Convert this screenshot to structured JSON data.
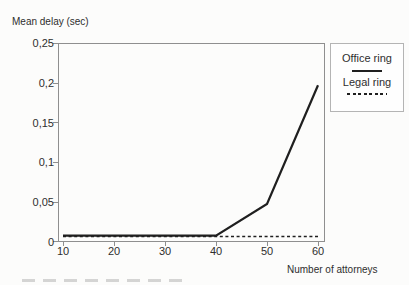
{
  "title": "Mean delay (sec)",
  "x_axis": {
    "label": "Number of attorneys",
    "ticks": [
      "10",
      "20",
      "30",
      "40",
      "50",
      "60"
    ]
  },
  "y_axis": {
    "ticks": [
      "0,25",
      "0,2",
      "0,15",
      "0,1",
      "0,05",
      "0"
    ]
  },
  "legend": {
    "items": [
      {
        "label": "Office ring",
        "style": "solid"
      },
      {
        "label": "Legal ring",
        "style": "dashed"
      }
    ]
  },
  "colors": {
    "line": "#1f1f1f",
    "text": "#2e2e2e",
    "plot_border": "#8f8f8f",
    "background": "#fcfcfb"
  },
  "chart_data": {
    "type": "line",
    "title": "Mean delay (sec)",
    "xlabel": "Number of attorneys",
    "ylabel": "Mean delay (sec)",
    "x": [
      10,
      20,
      30,
      40,
      50,
      60
    ],
    "series": [
      {
        "name": "Office ring",
        "style": "solid",
        "values": [
          0.008,
          0.008,
          0.008,
          0.008,
          0.048,
          0.198
        ]
      },
      {
        "name": "Legal ring",
        "style": "dashed",
        "values": [
          0.007,
          0.007,
          0.007,
          0.007,
          0.007,
          0.007
        ]
      }
    ],
    "xlim": [
      10,
      60
    ],
    "ylim": [
      0,
      0.25
    ],
    "y_tick_step": 0.05,
    "grid": false,
    "legend_position": "right",
    "decimal_separator": ","
  }
}
